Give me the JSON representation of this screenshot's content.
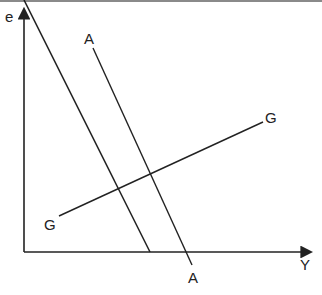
{
  "diagram": {
    "title": "",
    "axes": {
      "y_label": "e",
      "x_label": "Y"
    },
    "curves": [
      {
        "name": "AA",
        "label_top": "A",
        "label_bottom": "A",
        "slope": "downward"
      },
      {
        "name": "GG",
        "label_left": "G",
        "label_right": "G",
        "slope": "upward"
      }
    ],
    "colors": {
      "line": "#222222",
      "background": "#ffffff",
      "top_rule": "#8a8a8a"
    }
  }
}
